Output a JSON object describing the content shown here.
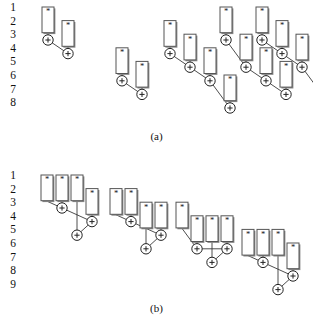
{
  "figure": {
    "mul_glyph": "*",
    "add_glyph": "+",
    "box_stroke": "#555555",
    "box_fill": "#ffffff",
    "box_shadow": "#8a8a8a",
    "node_stroke": "#222222",
    "edge_color": "#3a3a3a",
    "text_color": "#111111"
  },
  "panel_a": {
    "caption": "(a)",
    "row_labels": [
      "1",
      "2",
      "3",
      "4",
      "5",
      "6",
      "7",
      "8"
    ],
    "row_count": 8,
    "trees": [
      {
        "id": "tree-a1",
        "boxes": [
          {
            "label": "*",
            "col": 0,
            "row_start": 1,
            "row_end": 3
          },
          {
            "label": "*",
            "col": 1,
            "row_start": 2,
            "row_end": 4
          }
        ],
        "nodes": [
          {
            "label": "+",
            "col": 0,
            "row": 3
          },
          {
            "label": "+",
            "col": 1,
            "row": 4
          }
        ]
      },
      {
        "id": "tree-a2",
        "boxes": [
          {
            "label": "*",
            "col": 0,
            "row_start": 4,
            "row_end": 6
          },
          {
            "label": "*",
            "col": 1,
            "row_start": 5,
            "row_end": 7
          }
        ],
        "nodes": [
          {
            "label": "+",
            "col": 0,
            "row": 6
          },
          {
            "label": "+",
            "col": 1,
            "row": 7
          }
        ]
      },
      {
        "id": "tree-a3",
        "boxes": [
          {
            "label": "*",
            "col": 0,
            "row_start": 2,
            "row_end": 4
          },
          {
            "label": "*",
            "col": 1,
            "row_start": 3,
            "row_end": 5
          },
          {
            "label": "*",
            "col": 2,
            "row_start": 4,
            "row_end": 6
          },
          {
            "label": "*",
            "col": 3,
            "row_start": 6,
            "row_end": 8
          }
        ],
        "nodes": [
          {
            "label": "+",
            "col": 0,
            "row": 4
          },
          {
            "label": "+",
            "col": 1,
            "row": 5
          },
          {
            "label": "+",
            "col": 2,
            "row": 6
          },
          {
            "label": "+",
            "col": 3,
            "row": 8
          }
        ]
      },
      {
        "id": "tree-a4",
        "boxes": [
          {
            "label": "*",
            "col": 0,
            "row_start": 1,
            "row_end": 3
          },
          {
            "label": "*",
            "col": 1,
            "row_start": 3,
            "row_end": 5
          },
          {
            "label": "*",
            "col": 2,
            "row_start": 4,
            "row_end": 6
          },
          {
            "label": "*",
            "col": 3,
            "row_start": 5,
            "row_end": 7
          }
        ],
        "nodes": [
          {
            "label": "+",
            "col": 0,
            "row": 3
          },
          {
            "label": "+",
            "col": 1,
            "row": 5
          },
          {
            "label": "+",
            "col": 2,
            "row": 6
          },
          {
            "label": "+",
            "col": 3,
            "row": 7
          }
        ]
      },
      {
        "id": "tree-a5",
        "boxes": [
          {
            "label": "*",
            "col": 0,
            "row_start": 1,
            "row_end": 3
          },
          {
            "label": "*",
            "col": 1,
            "row_start": 2,
            "row_end": 4
          },
          {
            "label": "*",
            "col": 2,
            "row_start": 3,
            "row_end": 5
          },
          {
            "label": "*",
            "col": 3,
            "row_start": 5,
            "row_end": 7
          }
        ],
        "nodes": [
          {
            "label": "+",
            "col": 0,
            "row": 3
          },
          {
            "label": "+",
            "col": 1,
            "row": 4
          },
          {
            "label": "+",
            "col": 2,
            "row": 5
          },
          {
            "label": "+",
            "col": 3,
            "row": 7
          }
        ]
      }
    ]
  },
  "panel_b": {
    "caption": "(b)",
    "row_labels": [
      "1",
      "2",
      "3",
      "4",
      "5",
      "6",
      "7",
      "8",
      "9"
    ],
    "row_count": 9,
    "trees": [
      {
        "id": "tree-b1",
        "boxes": [
          {
            "label": "*",
            "col": 0,
            "row_start": 1,
            "row_end": 3
          },
          {
            "label": "*",
            "col": 1,
            "row_start": 1,
            "row_end": 3
          },
          {
            "label": "*",
            "col": 2,
            "row_start": 1,
            "row_end": 3
          },
          {
            "label": "*",
            "col": 3,
            "row_start": 2,
            "row_end": 4
          }
        ],
        "nodes": [
          {
            "label": "+",
            "col": 1,
            "row": 3
          },
          {
            "label": "+",
            "col": 3,
            "row": 4
          },
          {
            "label": "+",
            "col": 2,
            "row": 5
          }
        ]
      },
      {
        "id": "tree-b2",
        "boxes": [
          {
            "label": "*",
            "col": 0,
            "row_start": 2,
            "row_end": 4
          },
          {
            "label": "*",
            "col": 1,
            "row_start": 2,
            "row_end": 4
          },
          {
            "label": "*",
            "col": 2,
            "row_start": 3,
            "row_end": 5
          },
          {
            "label": "*",
            "col": 3,
            "row_start": 3,
            "row_end": 5
          }
        ],
        "nodes": [
          {
            "label": "+",
            "col": 1,
            "row": 4
          },
          {
            "label": "+",
            "col": 3,
            "row": 5
          },
          {
            "label": "+",
            "col": 2,
            "row": 6
          }
        ]
      },
      {
        "id": "tree-b3",
        "boxes": [
          {
            "label": "*",
            "col": 0,
            "row_start": 3,
            "row_end": 5
          },
          {
            "label": "*",
            "col": 1,
            "row_start": 4,
            "row_end": 6
          },
          {
            "label": "*",
            "col": 2,
            "row_start": 4,
            "row_end": 6
          },
          {
            "label": "*",
            "col": 3,
            "row_start": 4,
            "row_end": 6
          }
        ],
        "nodes": [
          {
            "label": "+",
            "col": 1,
            "row": 6
          },
          {
            "label": "+",
            "col": 3,
            "row": 6
          },
          {
            "label": "+",
            "col": 2,
            "row": 7
          }
        ]
      },
      {
        "id": "tree-b4",
        "boxes": [
          {
            "label": "*",
            "col": 0,
            "row_start": 5,
            "row_end": 7
          },
          {
            "label": "*",
            "col": 1,
            "row_start": 5,
            "row_end": 7
          },
          {
            "label": "*",
            "col": 2,
            "row_start": 5,
            "row_end": 7
          },
          {
            "label": "*",
            "col": 3,
            "row_start": 6,
            "row_end": 8
          }
        ],
        "nodes": [
          {
            "label": "+",
            "col": 1,
            "row": 7
          },
          {
            "label": "+",
            "col": 3,
            "row": 8
          },
          {
            "label": "+",
            "col": 2,
            "row": 9
          }
        ]
      }
    ]
  }
}
